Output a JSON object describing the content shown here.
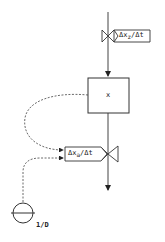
{
  "diagram": {
    "type": "system-dynamics-flow",
    "stock": {
      "label": "x"
    },
    "inflow": {
      "label_prefix": "Δx",
      "label_sub": "z",
      "label_suffix": "/Δt",
      "icon": "valve-icon"
    },
    "outflow": {
      "label_prefix": "Δx",
      "label_sub": "a",
      "label_suffix": "/Δt",
      "icon": "valve-icon"
    },
    "auxiliary": {
      "label": "1/D",
      "icon": "auxiliary-circle-icon"
    },
    "connections": [
      {
        "from": "stock",
        "to": "outflow",
        "style": "dashed"
      },
      {
        "from": "auxiliary",
        "to": "outflow",
        "style": "dashed"
      }
    ],
    "colors": {
      "line": "#333333",
      "background": "#ffffff"
    }
  }
}
